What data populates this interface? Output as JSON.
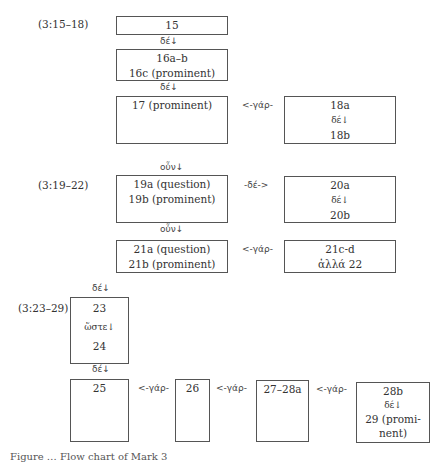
{
  "sections": [
    {
      "ref": "(3:15–18)",
      "boxes": [
        {
          "id": "b15",
          "lines": [
            "15"
          ]
        },
        {
          "id": "b16",
          "lines": [
            "16a–b",
            "16c (prominent)"
          ]
        },
        {
          "id": "b17",
          "lines": [
            "17 (prominent)"
          ]
        },
        {
          "id": "b18",
          "lines": [
            "18a",
            "δέ↓",
            "18b"
          ]
        }
      ],
      "connectors": [
        "δέ↓",
        "δέ↓",
        "<-γάρ-"
      ]
    },
    {
      "ref": "(3:19–22)",
      "boxes": [
        {
          "id": "b19",
          "lines": [
            "19a (question)",
            "19b (prominent)"
          ]
        },
        {
          "id": "b20",
          "lines": [
            "20a",
            "δέ↓",
            "20b"
          ]
        },
        {
          "id": "b21",
          "lines": [
            "21a (question)",
            "21b (prominent)"
          ]
        },
        {
          "id": "b21c",
          "lines": [
            "21c-d",
            "ἀλλά 22"
          ]
        }
      ],
      "connectors": [
        "οὖν↓",
        "-δέ->",
        "οὖν↓",
        "<-γάρ-"
      ]
    },
    {
      "ref": "(3:23–29)",
      "boxes": [
        {
          "id": "b23",
          "lines": [
            "23",
            "ὥστε↓",
            "24"
          ]
        },
        {
          "id": "b25",
          "lines": [
            "25"
          ]
        },
        {
          "id": "b26",
          "lines": [
            "26"
          ]
        },
        {
          "id": "b27",
          "lines": [
            "27–28a"
          ]
        },
        {
          "id": "b28",
          "lines": [
            "28b",
            "δέ↓",
            "29 (promi-",
            "nent)"
          ]
        }
      ],
      "connectors": [
        "δέ↓",
        "δέ↓",
        "<-γάρ-",
        "<-γάρ-",
        "<-γάρ-"
      ]
    }
  ],
  "caption": "Figure … Flow chart of Mark 3"
}
